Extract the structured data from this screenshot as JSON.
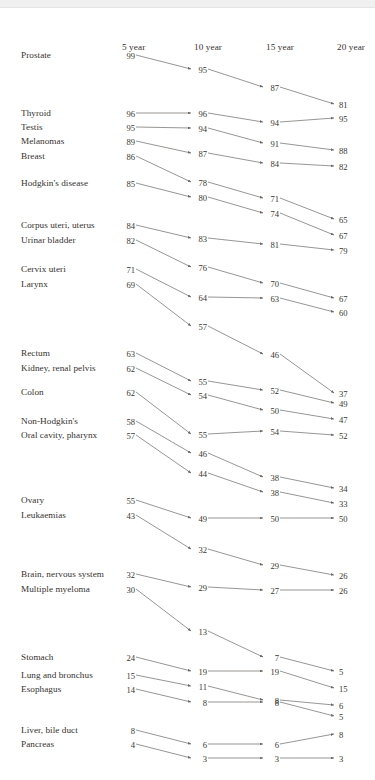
{
  "figure": {
    "type": "slopegraph",
    "title": "",
    "columns": [
      "5 year",
      "10 year",
      "15 year",
      "20 year"
    ],
    "column_x": [
      122,
      194,
      266,
      337
    ],
    "header_y": 42,
    "label_x": 21,
    "value_color": "#3a3733",
    "line_color": "#6b6866",
    "background": "#ffffff"
  },
  "chart_data": {
    "type": "line",
    "title": "",
    "subtitle": "",
    "xlabel": "",
    "ylabel": "",
    "x": [
      "5 year",
      "10 year",
      "15 year",
      "20 year"
    ],
    "categories": [
      "5 year",
      "10 year",
      "15 year",
      "20 year"
    ],
    "grid": false,
    "legend": "none",
    "axis_note": "Survival rates in percent; vertical position encodes value",
    "series": [
      {
        "name": "Prostate",
        "values": [
          99,
          95,
          87,
          81
        ],
        "y": [
          57,
          71,
          89,
          106
        ]
      },
      {
        "name": "Thyroid",
        "values": [
          96,
          96,
          94,
          95
        ],
        "y": [
          115,
          115,
          124,
          120
        ]
      },
      {
        "name": "Testis",
        "values": [
          95,
          94,
          91,
          88
        ],
        "y": [
          129,
          130,
          145,
          152
        ]
      },
      {
        "name": "Melanomas",
        "values": [
          89,
          87,
          84,
          82
        ],
        "y": [
          143,
          155,
          165,
          168
        ]
      },
      {
        "name": "Breast",
        "values": [
          86,
          78,
          71,
          65
        ],
        "y": [
          158,
          184,
          200,
          221
        ]
      },
      {
        "name": "Hodgkin's disease",
        "values": [
          85,
          80,
          74,
          67
        ],
        "y": [
          185,
          199,
          215,
          237
        ]
      },
      {
        "name": "Corpus uteri, uterus",
        "values": [
          84,
          83,
          81,
          79
        ],
        "y": [
          227,
          240,
          246,
          252
        ]
      },
      {
        "name": "Urinar bladder",
        "values": [
          82,
          76,
          70,
          67
        ],
        "y": [
          242,
          269,
          285,
          300
        ]
      },
      {
        "name": "Cervix uteri",
        "values": [
          71,
          64,
          63,
          60
        ],
        "y": [
          271,
          299,
          300,
          314
        ]
      },
      {
        "name": "Larynx",
        "values": [
          69,
          57,
          46,
          37
        ],
        "y": [
          286,
          328,
          356,
          395
        ]
      },
      {
        "name": "Rectum",
        "values": [
          63,
          55,
          52,
          49
        ],
        "y": [
          355,
          383,
          392,
          405
        ]
      },
      {
        "name": "Kidney, renal pelvis",
        "values": [
          62,
          54,
          50,
          47
        ],
        "y": [
          370,
          397,
          412,
          421
        ]
      },
      {
        "name": "Colon",
        "values": [
          62,
          55,
          54,
          52
        ],
        "y": [
          394,
          436,
          433,
          437
        ]
      },
      {
        "name": "Non-Hodgkin's",
        "values": [
          58,
          46,
          38,
          34
        ],
        "y": [
          423,
          455,
          479,
          490
        ]
      },
      {
        "name": "Oral cavity, pharynx",
        "values": [
          57,
          44,
          38,
          33
        ],
        "y": [
          437,
          475,
          494,
          505
        ]
      },
      {
        "name": "Ovary",
        "values": [
          55,
          49,
          50,
          50
        ],
        "y": [
          502,
          520,
          520,
          520
        ]
      },
      {
        "name": "Leukaemias",
        "values": [
          43,
          32,
          29,
          26
        ],
        "y": [
          517,
          551,
          567,
          577
        ]
      },
      {
        "name": "Brain, nervous system",
        "values": [
          32,
          29,
          27,
          26
        ],
        "y": [
          576,
          589,
          592,
          592
        ]
      },
      {
        "name": "Multiple myeloma",
        "values": [
          30,
          13,
          7,
          5
        ],
        "y": [
          591,
          633,
          659,
          673
        ]
      },
      {
        "name": "Stomach",
        "values": [
          24,
          19,
          19,
          15
        ],
        "y": [
          659,
          673,
          673,
          690
        ]
      },
      {
        "name": "Lung and bronchus",
        "values": [
          15,
          11,
          8,
          6
        ],
        "y": [
          677,
          688,
          702,
          707
        ]
      },
      {
        "name": "Esophagus",
        "values": [
          14,
          8,
          8,
          5
        ],
        "y": [
          691,
          704,
          704,
          718
        ]
      },
      {
        "name": "Liver, bile duct",
        "values": [
          8,
          6,
          6,
          8
        ],
        "y": [
          732,
          746,
          746,
          736
        ]
      },
      {
        "name": "Pancreas",
        "values": [
          4,
          3,
          3,
          3
        ],
        "y": [
          746,
          760,
          760,
          760
        ]
      }
    ]
  }
}
